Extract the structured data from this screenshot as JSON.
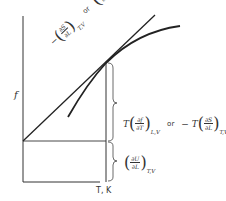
{
  "diagram": {
    "type": "thermodynamics force-temperature plot",
    "y_axis_label": "f",
    "x_axis_label": "T, K",
    "slope_label": {
      "term1": {
        "prefix": "−",
        "numerator": "∂S",
        "denominator": "∂L",
        "subscript": "T,V"
      },
      "connector": "or",
      "term2": {
        "numerator": "∂f",
        "denominator": "∂T",
        "subscript": "L,V"
      }
    },
    "upper_brace_label": {
      "term1": {
        "prefix": "T",
        "numerator": "∂f",
        "denominator": "∂T",
        "subscript": "L,V"
      },
      "connector": "or",
      "term2": {
        "prefix": "− T",
        "numerator": "∂S",
        "denominator": "∂L",
        "subscript": "T,V"
      }
    },
    "lower_brace_label": {
      "term1": {
        "numerator": "∂U",
        "denominator": "∂L",
        "subscript": "T,V"
      }
    },
    "colors": {
      "line": "#222222",
      "text": "#333333",
      "background": "#ffffff"
    }
  }
}
